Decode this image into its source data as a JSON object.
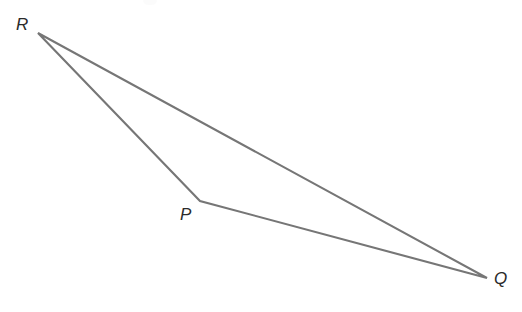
{
  "figure": {
    "type": "geometry-diagram",
    "shape": "triangle",
    "name": "Triangle PQR",
    "background_color": "#ffffff",
    "stroke_color": "#767676",
    "stroke_width": 2.1,
    "label_color": "#2b2b2b",
    "canvas": {
      "width": 522,
      "height": 312
    },
    "vertices": [
      {
        "id": "R",
        "label": "R",
        "x": 38,
        "y": 33,
        "label_x": 16,
        "label_y": 16
      },
      {
        "id": "P",
        "label": "P",
        "x": 200,
        "y": 201,
        "label_x": 180,
        "label_y": 206
      },
      {
        "id": "Q",
        "label": "Q",
        "x": 487,
        "y": 278,
        "label_x": 494,
        "label_y": 270
      }
    ],
    "edges": [
      {
        "id": "RP",
        "from": "R",
        "to": "P"
      },
      {
        "id": "PQ",
        "from": "P",
        "to": "Q"
      },
      {
        "id": "QR",
        "from": "Q",
        "to": "R"
      }
    ],
    "path": "M 38 33 L 200 201 L 487 278 Z"
  }
}
